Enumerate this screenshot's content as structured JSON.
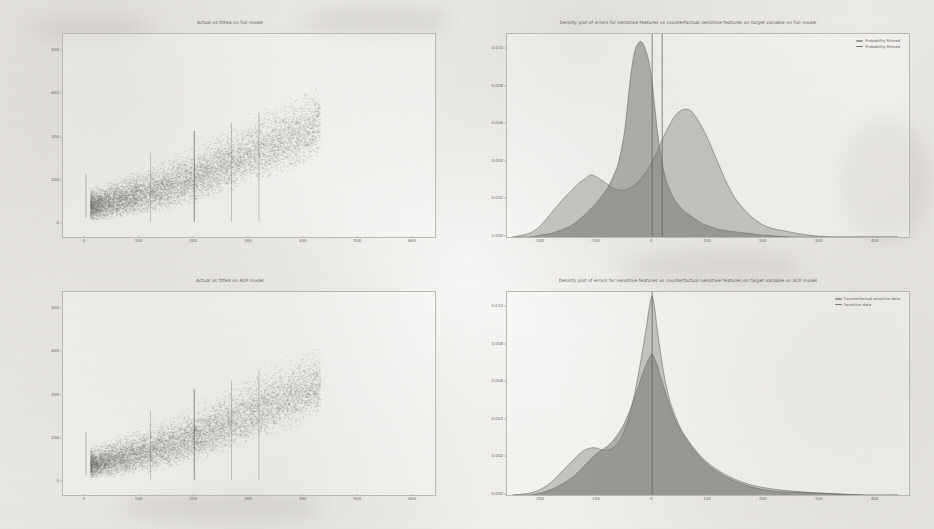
{
  "page": {
    "background_color": "#f1efec",
    "figure_count": 4
  },
  "panels": {
    "top_left": {
      "name": "actual-vs-fitted-full-model"
    },
    "top_right": {
      "name": "density-errors-full-model"
    },
    "bottom_left": {
      "name": "actual-vs-fitted-acf-model"
    },
    "bottom_right": {
      "name": "density-errors-acf-model"
    }
  },
  "chart_data": [
    {
      "id": "actual_vs_fitted_full",
      "type": "scatter",
      "title": "Actual vs fitted on full model",
      "xlabel": "",
      "ylabel": "",
      "xlim": [
        -40,
        640
      ],
      "ylim": [
        -60,
        880
      ],
      "xticks": [
        0,
        100,
        200,
        300,
        400,
        500,
        600
      ],
      "xticklabels": [
        "0",
        "100",
        "200",
        "300",
        "400",
        "500",
        "600"
      ],
      "yticks": [
        0,
        200,
        400,
        600,
        800
      ],
      "yticklabels": [
        "0",
        "200",
        "400",
        "600",
        "800"
      ],
      "grid": false,
      "legend": null,
      "marker_color": "#6f6e6b",
      "marker_alpha": 0.25,
      "n_points_approx": 9000,
      "cloud_description": "Dense positively-sloped band of points from origin rising to the right; widening scatter; thin vertical stripes of repeated x values; sparse upper tail extending toward x=420, y=680",
      "cloud_envelope": [
        {
          "x": 10,
          "y_low": 10,
          "y_high": 180
        },
        {
          "x": 40,
          "y_low": 15,
          "y_high": 210
        },
        {
          "x": 80,
          "y_low": 25,
          "y_high": 260
        },
        {
          "x": 120,
          "y_low": 40,
          "y_high": 300
        },
        {
          "x": 160,
          "y_low": 60,
          "y_high": 340
        },
        {
          "x": 200,
          "y_low": 85,
          "y_high": 390
        },
        {
          "x": 240,
          "y_low": 115,
          "y_high": 440
        },
        {
          "x": 280,
          "y_low": 150,
          "y_high": 500
        },
        {
          "x": 320,
          "y_low": 185,
          "y_high": 560
        },
        {
          "x": 360,
          "y_low": 220,
          "y_high": 600
        },
        {
          "x": 400,
          "y_low": 260,
          "y_high": 650
        },
        {
          "x": 430,
          "y_low": 300,
          "y_high": 690
        }
      ]
    },
    {
      "id": "density_errors_full",
      "type": "area",
      "title": "Density plot of errors for sensitive features vs counterfactual sensitive features on target variable on full model",
      "xlabel": "",
      "ylabel": "",
      "xlim": [
        -260,
        460
      ],
      "ylim": [
        0,
        0.0108
      ],
      "xticks": [
        -200,
        -100,
        0,
        100,
        200,
        300,
        400
      ],
      "xticklabels": [
        "-200",
        "-100",
        "0",
        "100",
        "200",
        "300",
        "400"
      ],
      "yticks": [
        0.0,
        0.002,
        0.004,
        0.006,
        0.008,
        0.01
      ],
      "yticklabels": [
        "0.000",
        "0.002",
        "0.004",
        "0.006",
        "0.008",
        "0.010"
      ],
      "grid": false,
      "legend_position": "upper right",
      "vlines": [
        {
          "x": 0,
          "color": "#5a5a5a",
          "label": "mean counterfactual"
        },
        {
          "x": 18,
          "color": "#5a5a5a",
          "label": "mean sensitive"
        }
      ],
      "series": [
        {
          "name": "Probability filtered",
          "color": "#9a9a96",
          "fill_alpha": 0.55,
          "x": [
            -250,
            -220,
            -200,
            -180,
            -160,
            -150,
            -140,
            -130,
            -120,
            -110,
            -100,
            -90,
            -80,
            -70,
            -60,
            -50,
            -40,
            -30,
            -20,
            -10,
            0,
            10,
            20,
            30,
            40,
            50,
            60,
            70,
            80,
            90,
            100,
            110,
            120,
            130,
            140,
            150,
            170,
            190,
            210,
            240,
            280,
            320,
            380,
            440
          ],
          "y": [
            0.0,
            0.0002,
            0.0006,
            0.0013,
            0.002,
            0.0023,
            0.0026,
            0.0029,
            0.0031,
            0.0033,
            0.0032,
            0.003,
            0.0028,
            0.0026,
            0.0025,
            0.0025,
            0.0026,
            0.0028,
            0.0031,
            0.0035,
            0.004,
            0.0046,
            0.0053,
            0.0059,
            0.0064,
            0.0067,
            0.0068,
            0.0067,
            0.0063,
            0.0058,
            0.0052,
            0.0045,
            0.0038,
            0.0031,
            0.0025,
            0.002,
            0.0013,
            0.0008,
            0.0005,
            0.0003,
            0.0001,
            0.0,
            0.0,
            0.0
          ]
        },
        {
          "name": "Probability filtered",
          "color": "#76766f",
          "fill_alpha": 0.55,
          "x": [
            -250,
            -220,
            -200,
            -180,
            -160,
            -140,
            -120,
            -110,
            -100,
            -90,
            -80,
            -70,
            -60,
            -50,
            -45,
            -40,
            -35,
            -30,
            -25,
            -20,
            -15,
            -10,
            -5,
            0,
            5,
            10,
            20,
            30,
            40,
            50,
            60,
            70,
            80,
            90,
            100,
            120,
            140,
            170,
            200,
            250,
            320,
            400,
            440
          ],
          "y": [
            0.0,
            0.0,
            0.0001,
            0.0002,
            0.0004,
            0.0007,
            0.0012,
            0.0015,
            0.0018,
            0.0022,
            0.0026,
            0.0032,
            0.004,
            0.0055,
            0.0068,
            0.0082,
            0.0093,
            0.01,
            0.0103,
            0.0104,
            0.0102,
            0.0098,
            0.0092,
            0.0082,
            0.0068,
            0.0055,
            0.0036,
            0.0026,
            0.002,
            0.0016,
            0.0013,
            0.0011,
            0.0009,
            0.0007,
            0.0006,
            0.0004,
            0.0003,
            0.0002,
            0.0001,
            0.0,
            0.0,
            0.0,
            0.0
          ]
        }
      ]
    },
    {
      "id": "actual_vs_fitted_acf",
      "type": "scatter",
      "title": "Actual vs fitted on ACF model",
      "xlabel": "",
      "ylabel": "",
      "xlim": [
        -40,
        640
      ],
      "ylim": [
        -60,
        880
      ],
      "xticks": [
        0,
        100,
        200,
        300,
        400,
        500,
        600
      ],
      "xticklabels": [
        "0",
        "100",
        "200",
        "300",
        "400",
        "500",
        "600"
      ],
      "yticks": [
        0,
        200,
        400,
        600,
        800
      ],
      "yticklabels": [
        "0",
        "200",
        "400",
        "600",
        "800"
      ],
      "grid": false,
      "legend": null,
      "marker_color": "#6f6e6b",
      "marker_alpha": 0.25,
      "n_points_approx": 9000,
      "cloud_description": "Same positively-sloped dense band as the full model, slightly tighter near the origin, sparse upper-right tail",
      "cloud_envelope": [
        {
          "x": 10,
          "y_low": 10,
          "y_high": 170
        },
        {
          "x": 40,
          "y_low": 15,
          "y_high": 205
        },
        {
          "x": 80,
          "y_low": 25,
          "y_high": 255
        },
        {
          "x": 120,
          "y_low": 40,
          "y_high": 295
        },
        {
          "x": 160,
          "y_low": 60,
          "y_high": 335
        },
        {
          "x": 200,
          "y_low": 85,
          "y_high": 385
        },
        {
          "x": 240,
          "y_low": 115,
          "y_high": 435
        },
        {
          "x": 280,
          "y_low": 150,
          "y_high": 495
        },
        {
          "x": 320,
          "y_low": 185,
          "y_high": 555
        },
        {
          "x": 360,
          "y_low": 220,
          "y_high": 595
        },
        {
          "x": 400,
          "y_low": 260,
          "y_high": 645
        },
        {
          "x": 430,
          "y_low": 300,
          "y_high": 685
        }
      ]
    },
    {
      "id": "density_errors_acf",
      "type": "area",
      "title": "Density plot of errors for sensitive features vs counterfactual sensitive features on target variable on ACF model",
      "xlabel": "",
      "ylabel": "",
      "xlim": [
        -260,
        460
      ],
      "ylim": [
        0,
        0.0108
      ],
      "xticks": [
        -200,
        -100,
        0,
        100,
        200,
        300,
        400
      ],
      "xticklabels": [
        "-200",
        "-100",
        "0",
        "100",
        "200",
        "300",
        "400"
      ],
      "yticks": [
        0.0,
        0.002,
        0.004,
        0.006,
        0.008,
        0.01
      ],
      "yticklabels": [
        "0.000",
        "0.002",
        "0.004",
        "0.006",
        "0.008",
        "0.010"
      ],
      "grid": false,
      "legend_position": "upper right",
      "vlines": [
        {
          "x": 0,
          "color": "#5a5a5a",
          "label": "mean"
        }
      ],
      "series": [
        {
          "name": "Counterfactual sensitive data",
          "color": "#9a9a96",
          "fill_alpha": 0.55,
          "x": [
            -250,
            -220,
            -200,
            -180,
            -170,
            -160,
            -150,
            -140,
            -130,
            -120,
            -110,
            -100,
            -90,
            -80,
            -70,
            -60,
            -50,
            -40,
            -30,
            -20,
            -10,
            -5,
            0,
            5,
            10,
            20,
            30,
            40,
            50,
            60,
            80,
            100,
            130,
            170,
            220,
            300,
            380,
            440
          ],
          "y": [
            0.0,
            0.0001,
            0.0003,
            0.0007,
            0.001,
            0.0013,
            0.0016,
            0.0019,
            0.0022,
            0.0024,
            0.0025,
            0.0025,
            0.0024,
            0.0024,
            0.0025,
            0.0028,
            0.0034,
            0.0043,
            0.0056,
            0.0072,
            0.009,
            0.01,
            0.0106,
            0.0098,
            0.0086,
            0.0066,
            0.0052,
            0.0043,
            0.0036,
            0.0031,
            0.0023,
            0.0017,
            0.0011,
            0.0006,
            0.0003,
            0.0001,
            0.0,
            0.0
          ]
        },
        {
          "name": "Sensitive data",
          "color": "#76766f",
          "fill_alpha": 0.55,
          "x": [
            -250,
            -220,
            -200,
            -180,
            -160,
            -150,
            -140,
            -130,
            -120,
            -110,
            -100,
            -90,
            -80,
            -70,
            -60,
            -50,
            -40,
            -30,
            -20,
            -10,
            -5,
            0,
            5,
            10,
            20,
            30,
            40,
            50,
            60,
            80,
            100,
            130,
            170,
            220,
            300,
            380,
            440
          ],
          "y": [
            0.0,
            0.0,
            0.0001,
            0.0003,
            0.0006,
            0.0008,
            0.001,
            0.0013,
            0.0016,
            0.0019,
            0.0022,
            0.0024,
            0.0026,
            0.0029,
            0.0033,
            0.0038,
            0.0045,
            0.0053,
            0.0062,
            0.007,
            0.0073,
            0.0075,
            0.0072,
            0.0068,
            0.0058,
            0.0049,
            0.0041,
            0.0035,
            0.003,
            0.0022,
            0.0016,
            0.001,
            0.0005,
            0.0002,
            0.0001,
            0.0,
            0.0
          ]
        }
      ]
    }
  ]
}
